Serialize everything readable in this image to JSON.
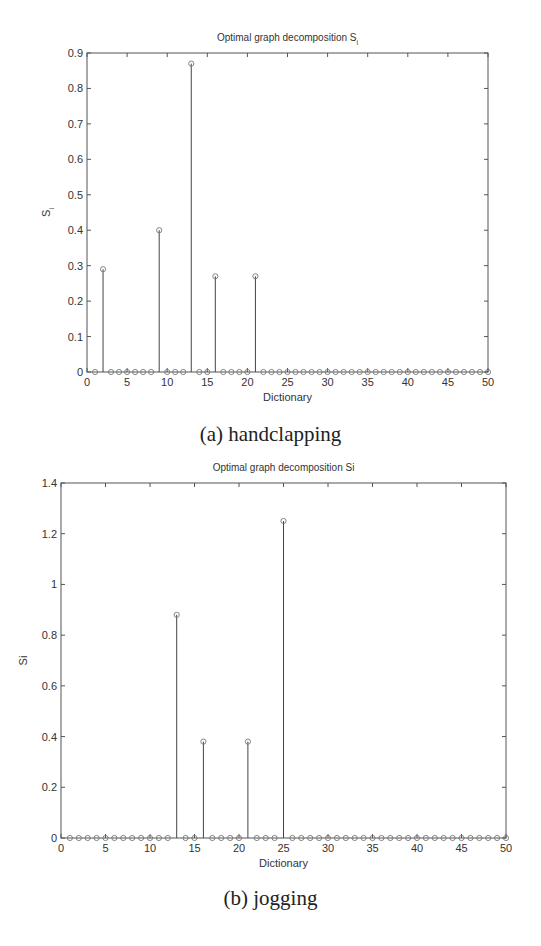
{
  "captions": {
    "a": "(a) handclapping",
    "b": "(b) jogging"
  },
  "chart_data": [
    {
      "type": "stem",
      "title": "Optimal graph decomposition S",
      "title_subscript": "i",
      "xlabel": "Dictionary",
      "ylabel": "S",
      "ylabel_subscript": "i",
      "xlim": [
        0,
        50
      ],
      "ylim": [
        0,
        0.9
      ],
      "xticks": [
        0,
        5,
        10,
        15,
        20,
        25,
        30,
        35,
        40,
        45,
        50
      ],
      "yticks": [
        0,
        0.1,
        0.2,
        0.3,
        0.4,
        0.5,
        0.6,
        0.7,
        0.8,
        0.9
      ],
      "ytick_labels": [
        "0",
        "0.1",
        "0.2",
        "0.3",
        "0.4",
        "0.5",
        "0.6",
        "0.7",
        "0.8",
        "0.9"
      ],
      "x": [
        1,
        2,
        3,
        4,
        5,
        6,
        7,
        8,
        9,
        10,
        11,
        12,
        13,
        14,
        15,
        16,
        17,
        18,
        19,
        20,
        21,
        22,
        23,
        24,
        25,
        26,
        27,
        28,
        29,
        30,
        31,
        32,
        33,
        34,
        35,
        36,
        37,
        38,
        39,
        40,
        41,
        42,
        43,
        44,
        45,
        46,
        47,
        48,
        49,
        50
      ],
      "values": [
        0,
        0.29,
        0,
        0,
        0,
        0,
        0,
        0,
        0.4,
        0,
        0,
        0,
        0.87,
        0,
        0,
        0.27,
        0,
        0,
        0,
        0,
        0.27,
        0,
        0,
        0,
        0,
        0,
        0,
        0,
        0,
        0,
        0,
        0,
        0,
        0,
        0,
        0,
        0,
        0,
        0,
        0,
        0,
        0,
        0,
        0,
        0,
        0,
        0,
        0,
        0,
        0
      ],
      "grid": false,
      "caption": "(a) handclapping"
    },
    {
      "type": "stem",
      "title": "Optimal graph decomposition Si",
      "title_subscript": "",
      "xlabel": "Dictionary",
      "ylabel": "Si",
      "ylabel_subscript": "",
      "xlim": [
        0,
        50
      ],
      "ylim": [
        0,
        1.4
      ],
      "xticks": [
        0,
        5,
        10,
        15,
        20,
        25,
        30,
        35,
        40,
        45,
        50
      ],
      "yticks": [
        0,
        0.2,
        0.4,
        0.6,
        0.8,
        1.0,
        1.2,
        1.4
      ],
      "ytick_labels": [
        "0",
        "0.2",
        "0.4",
        "0.6",
        "0.8",
        "1",
        "1.2",
        "1.4"
      ],
      "x": [
        1,
        2,
        3,
        4,
        5,
        6,
        7,
        8,
        9,
        10,
        11,
        12,
        13,
        14,
        15,
        16,
        17,
        18,
        19,
        20,
        21,
        22,
        23,
        24,
        25,
        26,
        27,
        28,
        29,
        30,
        31,
        32,
        33,
        34,
        35,
        36,
        37,
        38,
        39,
        40,
        41,
        42,
        43,
        44,
        45,
        46,
        47,
        48,
        49,
        50
      ],
      "values": [
        0,
        0,
        0,
        0,
        0,
        0,
        0,
        0,
        0,
        0,
        0,
        0,
        0.88,
        0,
        0,
        0.38,
        0,
        0,
        0,
        0,
        0.38,
        0,
        0,
        0,
        1.25,
        0,
        0,
        0,
        0,
        0,
        0,
        0,
        0,
        0,
        0,
        0,
        0,
        0,
        0,
        0,
        0,
        0,
        0,
        0,
        0,
        0,
        0,
        0,
        0,
        0
      ],
      "grid": false,
      "caption": "(b) jogging"
    }
  ]
}
